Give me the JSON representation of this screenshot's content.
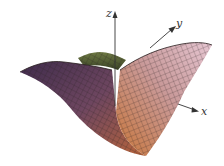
{
  "figure": {
    "type": "3d-surface-plot",
    "axes": {
      "x_label": "x",
      "y_label": "y",
      "z_label": "z"
    },
    "colors": {
      "background": "#ffffff",
      "surface_left": "#5a3b5e",
      "surface_back": "#4f5e33",
      "surface_front": "#c9763f",
      "surface_right": "#d9b3c0",
      "mesh_lines": "#2a1f1f",
      "axis": "#333333"
    }
  }
}
